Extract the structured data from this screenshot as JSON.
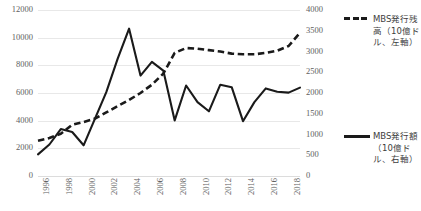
{
  "chart_data": {
    "type": "line",
    "title": "",
    "xlabel": "",
    "ylabel": "",
    "grid": true,
    "legend_position": "right",
    "x": [
      1996,
      1997,
      1998,
      1999,
      2000,
      2001,
      2002,
      2003,
      2004,
      2005,
      2006,
      2007,
      2008,
      2009,
      2010,
      2011,
      2012,
      2013,
      2014,
      2015,
      2016,
      2017,
      2018,
      2019
    ],
    "xtick_labels": [
      "1996",
      "1998",
      "2000",
      "2002",
      "2004",
      "2006",
      "2008",
      "2010",
      "2012",
      "2014",
      "2016",
      "2018"
    ],
    "left_axis": {
      "ticks": [
        0,
        2000,
        4000,
        6000,
        8000,
        10000,
        12000
      ],
      "tick_labels": [
        "0",
        "2000",
        "4000",
        "6000",
        "8000",
        "10000",
        "12000"
      ],
      "ylim": [
        0,
        12000
      ]
    },
    "right_axis": {
      "ticks": [
        0,
        500,
        1000,
        1500,
        2000,
        2500,
        3000,
        3500,
        4000
      ],
      "tick_labels": [
        "0",
        "500",
        "1000",
        "1500",
        "2000",
        "2500",
        "3000",
        "3500",
        "4000"
      ],
      "ylim": [
        0,
        4000
      ]
    },
    "series": [
      {
        "name": "MBS発行残高（10億ドル、左軸）",
        "key": "dashed-line",
        "axis": "left",
        "style": "dashed",
        "color": "#1a1a1a",
        "values": [
          2550,
          2750,
          3050,
          3700,
          3900,
          4150,
          4600,
          5050,
          5500,
          6000,
          6600,
          7400,
          8900,
          9250,
          9200,
          9100,
          9000,
          8850,
          8800,
          8800,
          8900,
          9050,
          9400,
          10350
        ]
      },
      {
        "name": "MBS発行額（10億ドル、右軸）",
        "key": "solid-line",
        "axis": "right",
        "style": "solid",
        "color": "#1a1a1a",
        "values": [
          520,
          760,
          1130,
          1060,
          740,
          1380,
          2020,
          2830,
          3550,
          2420,
          2750,
          2540,
          1340,
          2180,
          1780,
          1560,
          2200,
          2140,
          1320,
          1780,
          2110,
          2030,
          2010,
          2130
        ]
      }
    ]
  },
  "legend": {
    "entries": [
      {
        "label": "MBS発行残高（10億ドル、左軸）",
        "style": "dashed"
      },
      {
        "label": "MBS発行額（10億ドル、右軸）",
        "style": "solid"
      }
    ]
  }
}
